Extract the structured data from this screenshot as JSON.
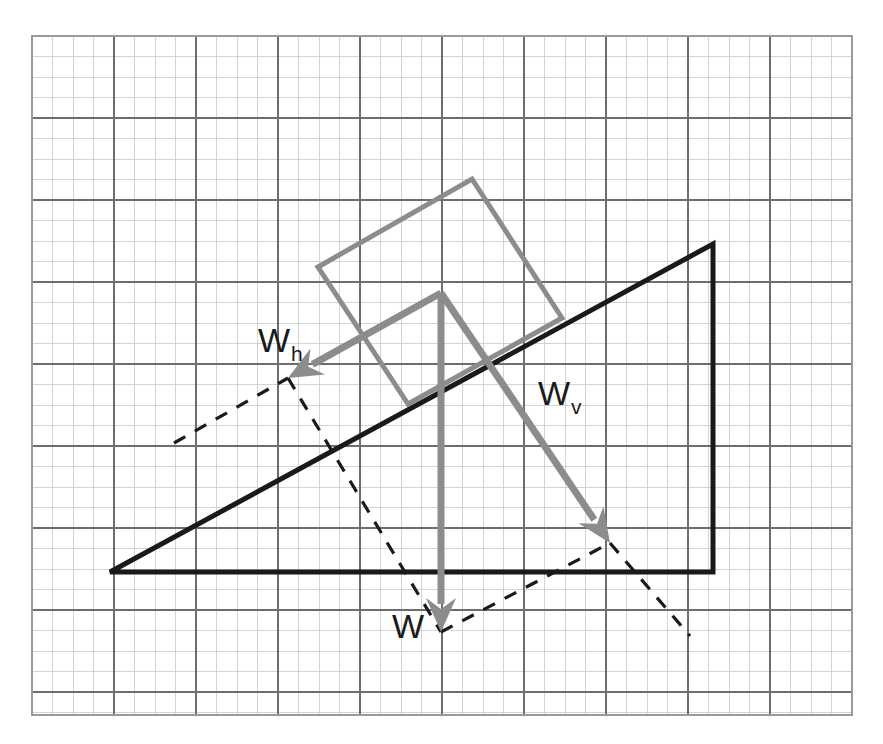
{
  "page": {
    "background_color": "#ffffff",
    "width": 883,
    "height": 744,
    "top_caption": ""
  },
  "colors": {
    "grid_minor": "#c9c9c9",
    "grid_major": "#6e6e6e",
    "grid_border": "#9a9a9a",
    "incline_stroke": "#1a1a1a",
    "block_stroke": "#8c8c8c",
    "vector_stroke": "#8c8c8c",
    "dashed_stroke": "#1a1a1a",
    "label_text": "#1a1a1a"
  },
  "grid": {
    "name": "graph-paper-grid",
    "x": 32,
    "y": 36,
    "width": 820,
    "height": 679,
    "minor_spacing": 20.5,
    "major_every": 4,
    "minor_width": 0.8,
    "major_width": 1.3,
    "border_width": 2
  },
  "incline": {
    "name": "inclined-plane-triangle",
    "stroke_width": 5,
    "vertices": [
      {
        "label": "base-left-vertex",
        "x": 110,
        "y": 572
      },
      {
        "label": "apex-top-right-vertex",
        "x": 713,
        "y": 244
      },
      {
        "label": "base-right-vertex",
        "x": 713,
        "y": 572
      }
    ]
  },
  "block": {
    "name": "tilted-block-rectangle",
    "stroke_width": 5,
    "corners": [
      {
        "label": "lower-left-corner",
        "x": 318,
        "y": 267
      },
      {
        "label": "upper-top-corner",
        "x": 472,
        "y": 179
      },
      {
        "label": "right-corner",
        "x": 562,
        "y": 318
      },
      {
        "label": "bottom-corner",
        "x": 408,
        "y": 404
      }
    ]
  },
  "vectors": {
    "origin": {
      "x": 441,
      "y": 293
    },
    "stroke_width": 7,
    "head_length": 34,
    "head_half_width": 15,
    "items": [
      {
        "name": "weight-horizontal-component-vector",
        "symbol": "W",
        "subscript": "h",
        "tip_x": 288,
        "tip_y": 378,
        "label_x": 258,
        "label_y": 352,
        "label_font_size": 34,
        "sub_font_size": 21
      },
      {
        "name": "weight-vertical-component-vector",
        "symbol": "W",
        "subscript": "v",
        "tip_x": 610,
        "tip_y": 543,
        "label_x": 538,
        "label_y": 405,
        "label_font_size": 34,
        "sub_font_size": 21
      },
      {
        "name": "weight-vector",
        "symbol": "W",
        "subscript": "",
        "tip_x": 441,
        "tip_y": 632,
        "label_x": 392,
        "label_y": 638,
        "label_font_size": 34,
        "sub_font_size": 21
      }
    ]
  },
  "construction_lines": {
    "name": "dashed-parallelogram-construction",
    "stroke_width": 3.2,
    "dash_pattern": "13,11",
    "segments": [
      {
        "name": "dash-upper-left-extension",
        "x1": 174,
        "y1": 443,
        "x2": 288,
        "y2": 378
      },
      {
        "name": "dash-left-to-weight-tip",
        "x1": 288,
        "y1": 378,
        "x2": 441,
        "y2": 632
      },
      {
        "name": "dash-weight-tip-to-vertical-tip",
        "x1": 441,
        "y1": 632,
        "x2": 610,
        "y2": 543
      },
      {
        "name": "dash-vertical-tip-extension",
        "x1": 610,
        "y1": 543,
        "x2": 690,
        "y2": 636
      }
    ]
  }
}
